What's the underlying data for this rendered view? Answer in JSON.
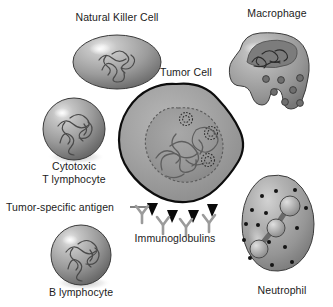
{
  "figure": {
    "background_color": "#ffffff",
    "width": 333,
    "height": 307,
    "style": "grayscale biomedical illustration"
  },
  "palette": {
    "outline": "#101010",
    "cell_light": "#d8d8d8",
    "cell_mid": "#9a9a9a",
    "cell_dark": "#6d6d6d",
    "nucleus_fill": "#8d8d8d",
    "granule": "#141414",
    "antigen": "#0a0a0a",
    "immunoglobulin": "#9b9b9b",
    "text": "#1b1b1b"
  },
  "labels": {
    "natural_killer_cell": "Natural Killer Cell",
    "macrophage": "Macrophage",
    "tumor_cell": "Tumor Cell",
    "cytotoxic_t_lymphocyte_line1": "Cytotoxic",
    "cytotoxic_t_lymphocyte_line2": "T lymphocyte",
    "tumor_specific_antigen": "Tumor-specific antigen",
    "immunoglobulins": "Immunoglobulins",
    "b_lymphocyte": "B lymphocyte",
    "neutrophil": "Neutrophil"
  },
  "cells": [
    {
      "id": "natural-killer-cell",
      "label": "Natural Killer Cell",
      "shape": "ellipse",
      "cx": 117,
      "cy": 62,
      "rx": 44,
      "ry": 27,
      "label_x": 117,
      "label_y": 17
    },
    {
      "id": "macrophage",
      "label": "Macrophage",
      "shape": "amoeboid",
      "cx": 275,
      "cy": 80,
      "granule_count": 7,
      "label_x": 277,
      "label_y": 13
    },
    {
      "id": "tumor-cell",
      "label": "Tumor Cell",
      "shape": "lobed-blob",
      "cx": 176,
      "cy": 150,
      "r": 67,
      "nucleolus_count": 3,
      "label_x": 186,
      "label_y": 71
    },
    {
      "id": "cytotoxic-t-lymphocyte",
      "label": "Cytotoxic T lymphocyte",
      "shape": "sphere",
      "cx": 74,
      "cy": 129,
      "r": 31,
      "label_x": 74,
      "label_y": 163
    },
    {
      "id": "b-lymphocyte",
      "label": "B lymphocyte",
      "shape": "sphere",
      "cx": 81,
      "cy": 255,
      "r": 30,
      "label_x": 81,
      "label_y": 288
    },
    {
      "id": "neutrophil",
      "label": "Neutrophil",
      "shape": "oval-tilted",
      "cx": 279,
      "cy": 232,
      "granule_count": 15,
      "nucleus_lobes": 3,
      "label_x": 281,
      "label_y": 286
    }
  ],
  "annotations": {
    "tumor_specific_antigen": {
      "text": "Tumor-specific antigen",
      "text_x": 6,
      "text_y": 203,
      "leader_from_x": 130,
      "leader_from_y": 209,
      "leader_to_x": 151,
      "leader_to_y": 209,
      "count": 4,
      "description": "black triangular spikes on tumor cell membrane"
    },
    "immunoglobulins": {
      "text": "Immunoglobulins",
      "text_x": 175,
      "text_y": 234,
      "count": 4,
      "description": "gray Y-shaped antibody molecules bound below the membrane"
    }
  }
}
